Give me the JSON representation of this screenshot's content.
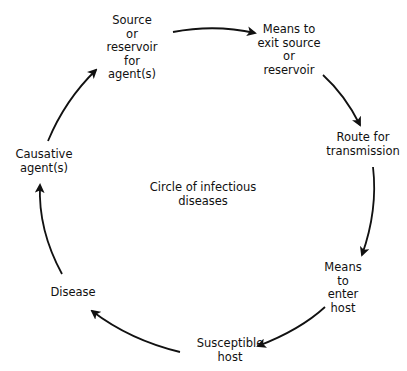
{
  "diagram": {
    "title": "Circle of infectious diseases",
    "title_lines": [
      "Circle of infectious",
      "diseases"
    ],
    "type": "cycle",
    "nodes": [
      {
        "id": "source",
        "lines": [
          "Source",
          "or",
          "reservoir",
          "for",
          "agent(s)"
        ]
      },
      {
        "id": "exit",
        "lines": [
          "Means to",
          "exit source",
          "or",
          "reservoir"
        ]
      },
      {
        "id": "route",
        "lines": [
          "Route for",
          "transmission"
        ]
      },
      {
        "id": "enter",
        "lines": [
          "Means",
          "to",
          "enter",
          "host"
        ]
      },
      {
        "id": "host",
        "lines": [
          "Susceptible",
          "host"
        ]
      },
      {
        "id": "disease",
        "lines": [
          "Disease"
        ]
      },
      {
        "id": "agent",
        "lines": [
          "Causative",
          "agent(s)"
        ]
      }
    ],
    "edges": [
      {
        "from": "source",
        "to": "exit"
      },
      {
        "from": "exit",
        "to": "route"
      },
      {
        "from": "route",
        "to": "enter"
      },
      {
        "from": "enter",
        "to": "host"
      },
      {
        "from": "host",
        "to": "disease"
      },
      {
        "from": "disease",
        "to": "agent"
      },
      {
        "from": "agent",
        "to": "source"
      }
    ],
    "colors": {
      "stroke": "#111111",
      "text": "#111111",
      "background": "#ffffff"
    }
  }
}
